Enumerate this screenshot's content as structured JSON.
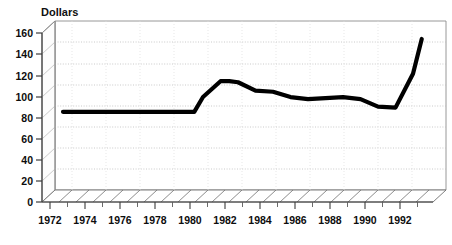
{
  "chart_data": {
    "type": "line",
    "title": "",
    "ylabel": "Dollars",
    "xlabel": "",
    "ylim": [
      0,
      160
    ],
    "xlim": [
      1972,
      1993
    ],
    "grid": true,
    "legend": "none",
    "style": "3d-perspective-scanned",
    "yticks": [
      0,
      20,
      40,
      60,
      80,
      100,
      120,
      140,
      160
    ],
    "ytick_labels": [
      "0",
      "20",
      "40",
      "60",
      "80",
      "100",
      "120",
      "140",
      "160"
    ],
    "xticks": [
      1972,
      1974,
      1976,
      1978,
      1980,
      1982,
      1984,
      1986,
      1988,
      1990,
      1992
    ],
    "xtick_labels": [
      "1972",
      "1974",
      "1976",
      "1978",
      "1980",
      "1982",
      "1984",
      "1986",
      "1988",
      "1990",
      "1992"
    ],
    "xminor_ticks": [
      1973,
      1975,
      1977,
      1979,
      1981,
      1983,
      1985,
      1987,
      1989,
      1991
    ],
    "series": [
      {
        "name": "Dollars",
        "x": [
          1972,
          1973,
          1974,
          1975,
          1976,
          1977,
          1978,
          1979,
          1979.5,
          1980,
          1981,
          1981.5,
          1982,
          1983,
          1984,
          1985,
          1986,
          1987,
          1988,
          1989,
          1990,
          1991,
          1992,
          1992.5
        ],
        "values": [
          74,
          74,
          74,
          74,
          74,
          74,
          74,
          74,
          74,
          88,
          103,
          103,
          102,
          94,
          93,
          88,
          86,
          87,
          88,
          86,
          79,
          78,
          110,
          143
        ]
      }
    ],
    "colors": {
      "line": "#000000",
      "grid": "#b9b9b9",
      "axis": "#4a4a4a",
      "background": "#ffffff",
      "text": "#0d0d0d"
    }
  },
  "axis": {
    "y_title": "Dollars"
  }
}
